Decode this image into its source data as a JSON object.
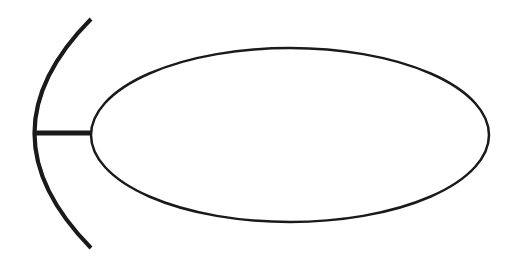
{
  "diagram": {
    "type": "interface-socket-ball",
    "background": "#ffffff",
    "stroke_color": "#1a1a1a",
    "socket_arc": {
      "start": [
        91,
        19
      ],
      "control": [
        -22,
        133
      ],
      "end": [
        91,
        248
      ],
      "stroke_width": 4
    },
    "connector": {
      "x1": 34,
      "y1": 133,
      "x2": 91,
      "y2": 133,
      "stroke_width": 5
    },
    "ellipse": {
      "cx": 290,
      "cy": 135,
      "rx": 199,
      "ry": 87,
      "stroke_width": 2.5
    }
  }
}
